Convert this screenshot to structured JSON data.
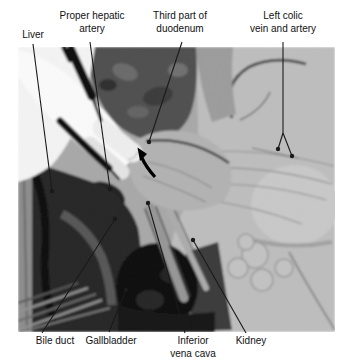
{
  "figure": {
    "type": "annotated-anatomical-dissection-photograph",
    "background_color": "#ffffff",
    "line_color": "#1a1a1a",
    "text_color": "#111111",
    "photo_frame": {
      "x": 18,
      "y": 47,
      "width": 317,
      "height": 285
    },
    "labels": {
      "liver": {
        "lines": [
          "Liver"
        ]
      },
      "proper_hepatic_artery": {
        "lines": [
          "Proper hepatic",
          "artery"
        ]
      },
      "third_part_of_duodenum": {
        "lines": [
          "Third part of",
          "duodenum"
        ]
      },
      "left_colic_vein_and_artery": {
        "lines": [
          "Left colic",
          "vein and artery"
        ]
      },
      "bile_duct": {
        "lines": [
          "Bile duct"
        ]
      },
      "gallbladder": {
        "lines": [
          "Gallbladder"
        ]
      },
      "inferior_vena_cava": {
        "lines": [
          "Inferior",
          "vena cava"
        ]
      },
      "kidney": {
        "lines": [
          "Kidney"
        ]
      }
    },
    "annotations": {
      "arrow_marker": {
        "type": "curved-arrow",
        "tip": [
          138,
          148
        ],
        "tail": [
          155,
          177
        ],
        "color": "#000000"
      },
      "leaders": [
        {
          "id": "liver",
          "segments": [
            [
              33,
              44,
              52,
              191
            ]
          ],
          "dots": [
            [
              52,
              191
            ]
          ]
        },
        {
          "id": "proper-hepatic-artery",
          "segments": [
            [
              90,
              42,
              110,
              189
            ]
          ],
          "dots": [
            [
              110,
              189
            ]
          ]
        },
        {
          "id": "third-part-of-duodenum",
          "segments": [
            [
              182,
              42,
              149,
              142
            ]
          ],
          "dots": [
            [
              149,
              142
            ]
          ]
        },
        {
          "id": "left-colic-vein-and-artery",
          "segments": [
            [
              283,
              42,
              283,
              133
            ],
            [
              283,
              133,
              278,
              149
            ],
            [
              283,
              133,
              292,
              156
            ]
          ],
          "dots": [
            [
              278,
              149
            ],
            [
              292,
              156
            ]
          ]
        },
        {
          "id": "bile-duct",
          "segments": [
            [
              42,
              333,
              115,
              219
            ]
          ],
          "dots": [
            [
              115,
              219
            ]
          ]
        },
        {
          "id": "gallbladder",
          "segments": [
            [
              109,
              332,
              126,
              290
            ]
          ],
          "dots": [
            [
              126,
              290
            ]
          ]
        },
        {
          "id": "inferior-vena-cava",
          "segments": [
            [
              185,
              333,
              148,
              203
            ]
          ],
          "dots": [
            [
              148,
              203
            ]
          ]
        },
        {
          "id": "kidney",
          "segments": [
            [
              246,
              333,
              193,
              240
            ]
          ],
          "dots": [
            [
              193,
              240
            ]
          ]
        }
      ]
    }
  }
}
